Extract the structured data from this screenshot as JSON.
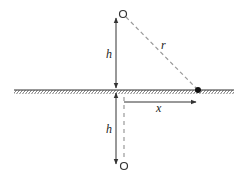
{
  "diagram": {
    "labels": {
      "upper_height": "h",
      "lower_height": "h",
      "distance": "r",
      "horizontal": "x"
    },
    "elements": {
      "source_point": "open-circle (above surface)",
      "image_point": "open-circle (below surface)",
      "observation_point": "filled-dot (on surface)",
      "surface": "hatched ground line"
    },
    "colors": {
      "line": "#333333",
      "dashed": "#999999",
      "dot": "#111111",
      "background": "#ffffff"
    }
  }
}
